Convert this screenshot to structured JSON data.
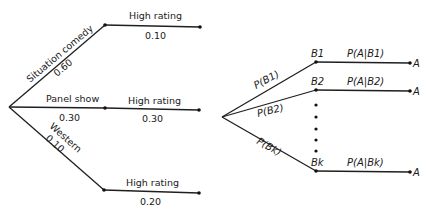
{
  "left_tree": {
    "branches": [
      {
        "category": "Situation comedy",
        "prob": "0.60",
        "outcome": "High rating",
        "cond_prob": "0.10"
      },
      {
        "category": "Panel show",
        "prob": "0.30",
        "outcome": "High rating",
        "cond_prob": "0.30"
      },
      {
        "category": "Western",
        "prob": "0.10",
        "outcome": "High rating",
        "cond_prob": "0.20"
      }
    ]
  },
  "right_tree": {
    "branches": [
      {
        "edge_label": "P(B1)",
        "node": "B1",
        "cond_label": "P(A|B1)",
        "end": "A"
      },
      {
        "edge_label": "P(B2)",
        "node": "B2",
        "cond_label": "P(A|B2)",
        "end": "A"
      },
      {
        "edge_label": "P(Bk)",
        "node": "Bk",
        "cond_label": "P(A|Bk)",
        "end": "A"
      }
    ],
    "ellipsis_dots": 5
  }
}
